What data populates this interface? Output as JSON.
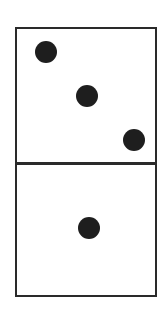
{
  "domino": {
    "top_half": {
      "pips": 3
    },
    "bottom_half": {
      "pips": 1
    },
    "colors": {
      "outline": "#2a2a2a",
      "pip": "#1e1e1e",
      "background": "#ffffff"
    }
  }
}
